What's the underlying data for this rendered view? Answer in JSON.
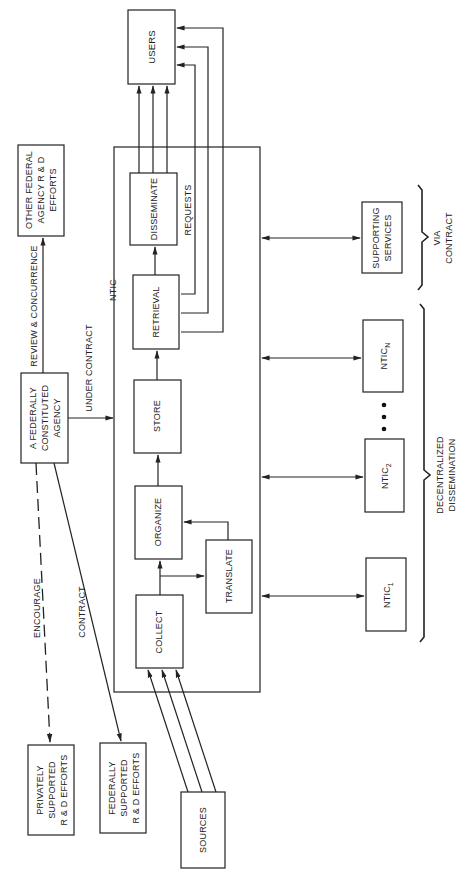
{
  "diagram": {
    "orientation": "rotated-90-ccw",
    "colors": {
      "line": "#222222",
      "background": "#ffffff"
    },
    "nodes": {
      "users": {
        "label": "USERS"
      },
      "other_federal": {
        "line1": "OTHER FEDERAL",
        "line2": "AGENCY R & D",
        "line3": "EFFORTS"
      },
      "ntic": {
        "label": "NTIC"
      },
      "disseminate": {
        "label": "DISSEMINATE"
      },
      "retrieval": {
        "label": "RETRIEVAL"
      },
      "store": {
        "label": "STORE"
      },
      "organize": {
        "label": "ORGANIZE"
      },
      "translate": {
        "label": "TRANSLATE"
      },
      "collect": {
        "label": "COLLECT"
      },
      "federal_agency": {
        "line1": "A FEDERALLY",
        "line2": "CONSTITUTED",
        "line3": "AGENCY"
      },
      "supporting_services": {
        "line1": "SUPPORTING",
        "line2": "SERVICES"
      },
      "ntic_n": {
        "base": "NTIC",
        "sub": "N"
      },
      "ntic_2": {
        "base": "NTIC",
        "sub": "2"
      },
      "ntic_1": {
        "base": "NTIC",
        "sub": "1"
      },
      "ellipsis": "• • •",
      "privately_supported": {
        "line1": "PRIVATELY",
        "line2": "SUPPORTED",
        "line3": "R & D EFFORTS"
      },
      "federally_supported": {
        "line1": "FEDERALLY",
        "line2": "SUPPORTED",
        "line3": "R & D EFFORTS"
      },
      "sources": {
        "label": "SOURCES"
      }
    },
    "edge_labels": {
      "review_concurrence": "REVIEW & CONCURRENCE",
      "under_contract": "UNDER CONTRACT",
      "requests": "REQUESTS",
      "encourage": "ENCOURAGE",
      "contract": "CONTRACT"
    },
    "brace_labels": {
      "via_contract": {
        "line1": "VIA",
        "line2": "CONTRACT"
      },
      "decentralized": {
        "line1": "DECENTRALIZED",
        "line2": "DISSEMINATION"
      }
    }
  }
}
